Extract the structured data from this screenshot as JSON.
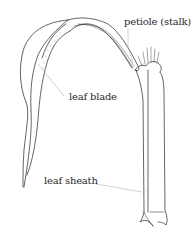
{
  "diagram": {
    "labels": {
      "petiole": "petiole (stalk)",
      "leaf_blade": "leaf blade",
      "leaf_sheath": "leaf sheath"
    },
    "colors": {
      "outline": "#222222",
      "leader_line": "#b5b5b5",
      "background": "#ffffff"
    }
  }
}
